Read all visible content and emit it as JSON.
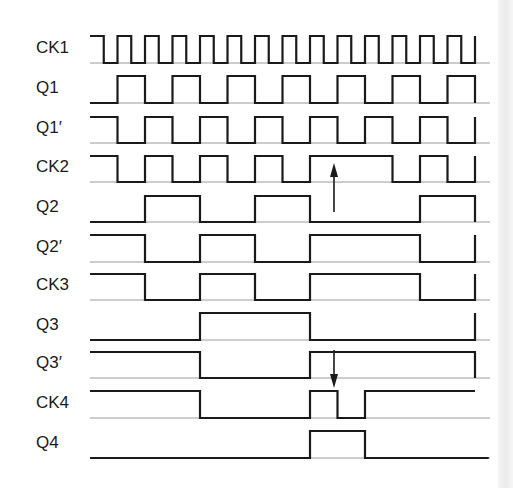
{
  "diagram": {
    "type": "timing-diagram",
    "time_unit_px": 13.75,
    "x_start": 90,
    "x_baseline_end": 490,
    "t_end": 28,
    "colors": {
      "trace": "#1a1a1a",
      "baseline": "#9a9a9a",
      "label": "#1a1a1a"
    },
    "signals": [
      {
        "name": "CK1",
        "label": "CK1",
        "high_y": 36,
        "low_y": 63,
        "start": 1,
        "edges": [
          1,
          2,
          3,
          4,
          5,
          6,
          7,
          8,
          9,
          10,
          11,
          12,
          13,
          14,
          15,
          16,
          17,
          18,
          19,
          20,
          21,
          22,
          23,
          24,
          25,
          26,
          27,
          28
        ],
        "end_mark": true
      },
      {
        "name": "Q1",
        "label": "Q1",
        "high_y": 76,
        "low_y": 103,
        "start": 0,
        "edges": [
          2,
          4,
          6,
          8,
          10,
          12,
          14,
          16,
          18,
          20,
          22,
          24,
          26,
          28
        ],
        "end_mark": false
      },
      {
        "name": "Q1-prime",
        "label": "Q1′",
        "high_y": 117,
        "low_y": 143,
        "start": 1,
        "edges": [
          2,
          4,
          6,
          8,
          10,
          12,
          14,
          16,
          18,
          20,
          22,
          24,
          26,
          28
        ],
        "end_mark": true
      },
      {
        "name": "CK2",
        "label": "CK2",
        "high_y": 156,
        "low_y": 182,
        "start": 1,
        "edges": [
          2,
          4,
          6,
          8,
          10,
          12,
          14,
          16,
          22,
          24,
          26,
          28
        ],
        "end_mark": true
      },
      {
        "name": "Q2",
        "label": "Q2",
        "high_y": 196,
        "low_y": 222,
        "start": 0,
        "edges": [
          4,
          8,
          12,
          16,
          24,
          28
        ],
        "end_mark": false
      },
      {
        "name": "Q2-prime",
        "label": "Q2′",
        "high_y": 235,
        "low_y": 262,
        "start": 1,
        "edges": [
          4,
          8,
          12,
          16,
          24,
          28
        ],
        "end_mark": true
      },
      {
        "name": "CK3",
        "label": "CK3",
        "high_y": 274,
        "low_y": 300,
        "start": 1,
        "edges": [
          4,
          8,
          12,
          16,
          24,
          28
        ],
        "end_mark": true
      },
      {
        "name": "Q3",
        "label": "Q3",
        "high_y": 313,
        "low_y": 340,
        "start": 0,
        "edges": [
          8,
          16,
          28
        ],
        "end_mark": true
      },
      {
        "name": "Q3-prime",
        "label": "Q3′",
        "high_y": 352,
        "low_y": 378,
        "start": 1,
        "edges": [
          8,
          16,
          28
        ],
        "end_mark": false
      },
      {
        "name": "CK4",
        "label": "CK4",
        "high_y": 391,
        "low_y": 418,
        "start": 1,
        "edges": [
          8,
          16,
          18,
          20
        ],
        "end_mark": false,
        "end_t": 28
      },
      {
        "name": "Q4",
        "label": "Q4",
        "high_y": 431,
        "low_y": 458,
        "start": 0,
        "edges": [
          16,
          20
        ],
        "end_mark": false,
        "end_t": 29
      }
    ],
    "annotations": [
      {
        "name": "up-arrow",
        "direction": "up",
        "x": 334,
        "y_from": 212,
        "y_to": 163,
        "near": "CK2"
      },
      {
        "name": "down-arrow",
        "direction": "down",
        "x": 334,
        "y_from": 350,
        "y_to": 388,
        "near": "Q3′ / CK4"
      }
    ]
  }
}
